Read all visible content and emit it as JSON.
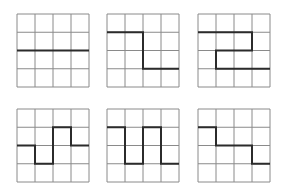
{
  "figure": {
    "grid_size": 4,
    "grid_line_color": "#8a8a8a",
    "path_color": "#2b2b2b",
    "grids": [
      {
        "id": "grid-1",
        "x": 16,
        "y": 13,
        "path": [
          [
            0,
            2
          ],
          [
            4,
            2
          ]
        ]
      },
      {
        "id": "grid-2",
        "x": 106,
        "y": 13,
        "path": [
          [
            0,
            1
          ],
          [
            2,
            1
          ],
          [
            2,
            3
          ],
          [
            4,
            3
          ]
        ]
      },
      {
        "id": "grid-3",
        "x": 197,
        "y": 13,
        "path": [
          [
            0,
            1
          ],
          [
            3,
            1
          ],
          [
            3,
            2
          ],
          [
            1,
            2
          ],
          [
            1,
            3
          ],
          [
            4,
            3
          ]
        ]
      },
      {
        "id": "grid-4",
        "x": 16,
        "y": 108,
        "path": [
          [
            0,
            2
          ],
          [
            1,
            2
          ],
          [
            1,
            3
          ],
          [
            2,
            3
          ],
          [
            2,
            1
          ],
          [
            3,
            1
          ],
          [
            3,
            2
          ],
          [
            4,
            2
          ]
        ]
      },
      {
        "id": "grid-5",
        "x": 106,
        "y": 108,
        "path": [
          [
            0,
            1
          ],
          [
            1,
            1
          ],
          [
            1,
            3
          ],
          [
            2,
            3
          ],
          [
            2,
            1
          ],
          [
            3,
            1
          ],
          [
            3,
            3
          ],
          [
            4,
            3
          ]
        ]
      },
      {
        "id": "grid-6",
        "x": 197,
        "y": 108,
        "path": [
          [
            0,
            1
          ],
          [
            1,
            1
          ],
          [
            1,
            2
          ],
          [
            3,
            2
          ],
          [
            3,
            3
          ],
          [
            4,
            3
          ]
        ]
      }
    ]
  }
}
